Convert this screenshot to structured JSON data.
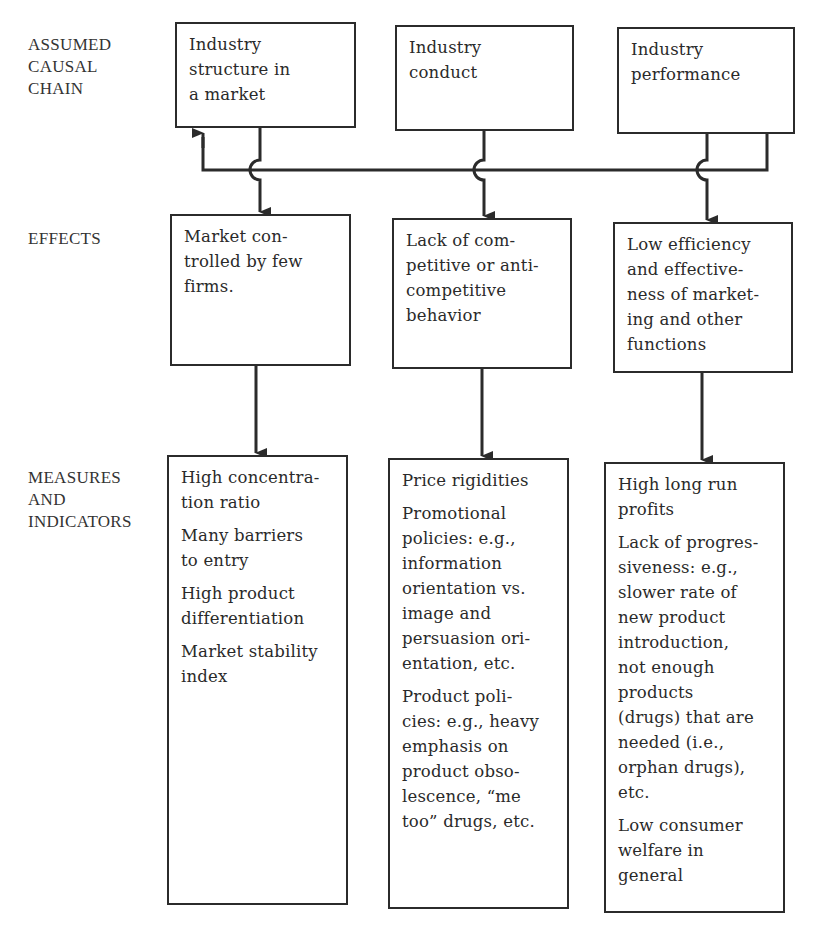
{
  "row_labels": {
    "causal_chain": "ASSUMED\nCAUSAL\nCHAIN",
    "effects": "EFFECTS",
    "measures": "MEASURES\nAND\nINDICATORS"
  },
  "causal_chain": [
    {
      "text": "Industry\nstructure in\na market"
    },
    {
      "text": "Industry\nconduct"
    },
    {
      "text": "Industry\nperformance"
    }
  ],
  "effects": [
    {
      "text": "Market con-\ntrolled by few\nfirms."
    },
    {
      "text": "Lack of com-\npetitive or anti-\ncompetitive\nbehavior"
    },
    {
      "text": "Low efficiency\nand effective-\nness of market-\ning and other\nfunctions"
    }
  ],
  "measures": [
    {
      "items": [
        "High concentra-\ntion ratio",
        "Many barriers\nto entry",
        "High product\ndifferentiation",
        "Market stability\nindex"
      ]
    },
    {
      "items": [
        "Price rigidities",
        "Promotional\npolicies: e.g.,\ninformation\norientation vs.\nimage and\npersuasion ori-\nentation, etc.",
        "Product poli-\ncies: e.g., heavy\nemphasis on\nproduct obso-\nlescence, “me\ntoo” drugs, etc."
      ]
    },
    {
      "items": [
        "High long run\nprofits",
        "Lack of progres-\nsiveness: e.g.,\nslower rate of\nnew product\nintroduction,\nnot enough\nproducts\n(drugs) that are\nneeded (i.e.,\norphan drugs),\netc.",
        "Low consumer\nwelfare in\ngeneral"
      ]
    }
  ],
  "colors": {
    "line": "#2b2b2b",
    "text": "#2a2a2a",
    "background": "#ffffff"
  }
}
